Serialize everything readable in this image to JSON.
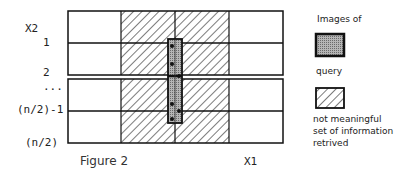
{
  "axes": {
    "y_label": "X2",
    "x_label": "X1",
    "row_labels": [
      "1",
      "2",
      "...",
      "(n/2)-1",
      "(n/2)"
    ]
  },
  "caption": "Figure 2",
  "legend": {
    "query_heading": "Images of",
    "query_label": "query",
    "hatch_label_lines": [
      "not meaningful",
      "set of information",
      "retrived"
    ]
  },
  "colors": {
    "line": "#111111",
    "query_fill": "#9a9a9a",
    "hatch": "#222222",
    "background": "#ffffff"
  }
}
